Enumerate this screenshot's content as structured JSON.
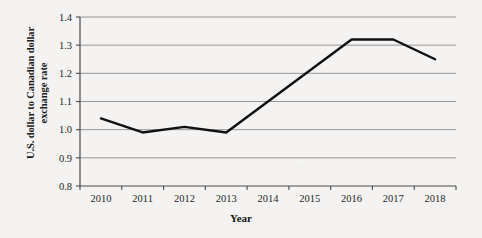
{
  "chart_data": {
    "type": "line",
    "title": "",
    "subtitle": "",
    "xlabel": "Year",
    "ylabel": "U.S. dollar to Canadian dollar exchange rate",
    "ylabel_line1": "U.S. dollar to Canadian dollar",
    "ylabel_line2": "exchange rate",
    "categories": [
      "2010",
      "2011",
      "2012",
      "2013",
      "2014",
      "2015",
      "2016",
      "2017",
      "2018"
    ],
    "x": [
      2010,
      2011,
      2012,
      2013,
      2014,
      2015,
      2016,
      2017,
      2018
    ],
    "values": [
      1.04,
      0.99,
      1.01,
      0.99,
      1.1,
      1.21,
      1.32,
      1.32,
      1.25
    ],
    "series": [
      {
        "name": "U.S. dollar to Canadian dollar exchange rate",
        "values": [
          1.04,
          0.99,
          1.01,
          0.99,
          1.1,
          1.21,
          1.32,
          1.32,
          1.25
        ]
      }
    ],
    "ylim": [
      0.8,
      1.4
    ],
    "ytick_values": [
      0.8,
      0.9,
      1.0,
      1.1,
      1.2,
      1.3,
      1.4
    ],
    "ytick_labels": [
      "0.8",
      "0.9",
      "1.0",
      "1.1",
      "1.2",
      "1.3",
      "1.4"
    ],
    "xtick_labels": [
      "2010",
      "2011",
      "2012",
      "2013",
      "2014",
      "2015",
      "2016",
      "2017",
      "2018"
    ],
    "grid": true,
    "grid_axis": "y",
    "legend": false,
    "legend_position": "none",
    "line_color": "#101010",
    "grid_color": "#8c8c8c",
    "axis_color": "#4a4a4a",
    "background_color": "#f4f3f1",
    "annotations": []
  }
}
